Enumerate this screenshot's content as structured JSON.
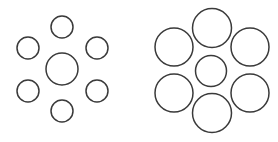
{
  "figure": {
    "background_color": "#ffffff",
    "stroke_color": "#3a3a3a",
    "stroke_width": 1.5,
    "width": 278,
    "height": 142
  },
  "chart_data": {
    "type": "scatter",
    "xlabel": "",
    "ylabel": "",
    "xlim": [
      0,
      278
    ],
    "ylim": [
      0,
      142
    ],
    "grid": false,
    "legend": "none",
    "annotations": [
      "Two central circles are the same physical size",
      "Left central circle is surrounded by small inducing circles",
      "Right central circle is surrounded by large inducing circles"
    ],
    "series": [
      {
        "name": "left-cluster-target",
        "marker": "open-circle",
        "values": [
          {
            "label": "left-center",
            "cx": 62,
            "cy": 69,
            "r": 16
          }
        ]
      },
      {
        "name": "left-cluster-inducers",
        "marker": "open-circle",
        "values": [
          {
            "label": "left-inducer-top",
            "cx": 62,
            "cy": 27,
            "r": 11
          },
          {
            "label": "left-inducer-upper-right",
            "cx": 97,
            "cy": 48,
            "r": 11
          },
          {
            "label": "left-inducer-lower-right",
            "cx": 97,
            "cy": 91,
            "r": 11
          },
          {
            "label": "left-inducer-bottom",
            "cx": 62,
            "cy": 111,
            "r": 11
          },
          {
            "label": "left-inducer-lower-left",
            "cx": 28,
            "cy": 91,
            "r": 11
          },
          {
            "label": "left-inducer-upper-left",
            "cx": 28,
            "cy": 48,
            "r": 11
          }
        ]
      },
      {
        "name": "right-cluster-target",
        "marker": "open-circle",
        "values": [
          {
            "label": "right-center",
            "cx": 211,
            "cy": 71,
            "r": 15.5
          }
        ]
      },
      {
        "name": "right-cluster-inducers",
        "marker": "open-circle",
        "values": [
          {
            "label": "right-inducer-top",
            "cx": 212,
            "cy": 28,
            "r": 19.5
          },
          {
            "label": "right-inducer-upper-right",
            "cx": 250,
            "cy": 47,
            "r": 19
          },
          {
            "label": "right-inducer-lower-right",
            "cx": 250,
            "cy": 93,
            "r": 19
          },
          {
            "label": "right-inducer-bottom",
            "cx": 212,
            "cy": 113,
            "r": 19.5
          },
          {
            "label": "right-inducer-lower-left",
            "cx": 174,
            "cy": 93,
            "r": 19
          },
          {
            "label": "right-inducer-upper-left",
            "cx": 174,
            "cy": 47,
            "r": 19
          }
        ]
      }
    ]
  }
}
